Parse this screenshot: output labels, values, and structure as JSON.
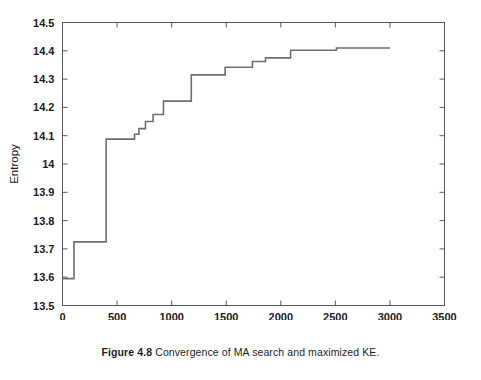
{
  "figure": {
    "caption_label": "Figure 4.8",
    "caption_text": "Convergence of MA search and maximized KE."
  },
  "colors": {
    "line": "#6e6e6e",
    "axis": "#595959",
    "text": "#1a1a1a",
    "background": "#ffffff"
  },
  "chart_data": {
    "type": "line",
    "title": "",
    "subtitle": "",
    "xlabel": "Number of iterations",
    "ylabel": "Entropy",
    "xlim": [
      0,
      3500
    ],
    "ylim": [
      13.5,
      14.5
    ],
    "xticks": [
      0,
      500,
      1000,
      1500,
      2000,
      2500,
      3000,
      3500
    ],
    "xtick_labels": [
      "0",
      "500",
      "1000",
      "1500",
      "2000",
      "2500",
      "3000",
      "3500"
    ],
    "yticks": [
      13.5,
      13.6,
      13.7,
      13.8,
      13.9,
      14.0,
      14.1,
      14.2,
      14.3,
      14.4,
      14.5
    ],
    "ytick_labels": [
      "13.5",
      "13.6",
      "13.7",
      "13.8",
      "13.9",
      "14",
      "14.1",
      "14.2",
      "14.3",
      "14.4",
      "14.5"
    ],
    "grid": false,
    "legend": null,
    "legend_position": "none",
    "drawstyle": "steps-post",
    "line_width": 1.6,
    "series": [
      {
        "name": "Maximized KE (best entropy so far)",
        "color": "#6e6e6e",
        "x": [
          0,
          105,
          400,
          610,
          660,
          700,
          760,
          830,
          900,
          925,
          1160,
          1180,
          1470,
          1490,
          1700,
          1740,
          1820,
          1860,
          2060,
          2090,
          2480,
          2510,
          3000
        ],
        "y": [
          13.595,
          13.595,
          13.725,
          14.088,
          14.088,
          14.105,
          14.125,
          14.15,
          14.175,
          14.175,
          14.222,
          14.222,
          14.315,
          14.315,
          14.342,
          14.342,
          14.362,
          14.362,
          14.375,
          14.375,
          14.402,
          14.402,
          14.41
        ],
        "steps": [
          {
            "x_start": 0,
            "x_end": 105,
            "value": 13.595
          },
          {
            "x_start": 105,
            "x_end": 400,
            "value": 13.725
          },
          {
            "x_start": 400,
            "x_end": 660,
            "value": 14.088
          },
          {
            "x_start": 660,
            "x_end": 700,
            "value": 14.105
          },
          {
            "x_start": 700,
            "x_end": 760,
            "value": 14.125
          },
          {
            "x_start": 760,
            "x_end": 830,
            "value": 14.15
          },
          {
            "x_start": 830,
            "x_end": 925,
            "value": 14.175
          },
          {
            "x_start": 925,
            "x_end": 1180,
            "value": 14.222
          },
          {
            "x_start": 1180,
            "x_end": 1490,
            "value": 14.315
          },
          {
            "x_start": 1490,
            "x_end": 1740,
            "value": 14.342
          },
          {
            "x_start": 1740,
            "x_end": 1860,
            "value": 14.362
          },
          {
            "x_start": 1860,
            "x_end": 2090,
            "value": 14.375
          },
          {
            "x_start": 2090,
            "x_end": 2510,
            "value": 14.402
          },
          {
            "x_start": 2510,
            "x_end": 3000,
            "value": 14.41
          }
        ]
      }
    ],
    "annotations": []
  }
}
